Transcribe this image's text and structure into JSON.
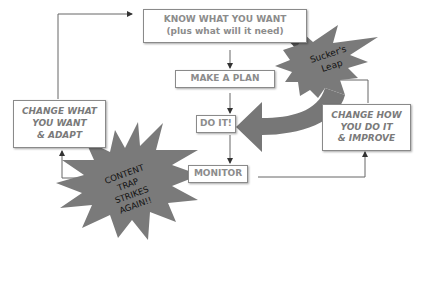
{
  "diagram": {
    "type": "flowchart",
    "nodes": {
      "know": {
        "line1": "KNOW WHAT YOU WANT",
        "line2": "(plus what will it need)"
      },
      "plan": {
        "label": "MAKE A PLAN"
      },
      "do": {
        "label": "DO IT!"
      },
      "monitor": {
        "label": "MONITOR"
      },
      "change_how": {
        "line1": "CHANGE HOW",
        "line2": "YOU DO IT",
        "line3": "& IMPROVE"
      },
      "change_what": {
        "line1": "CHANGE WHAT",
        "line2": "YOU WANT",
        "line3": "& ADAPT"
      }
    },
    "bursts": {
      "suckers_leap": {
        "line1": "Sucker's",
        "line2": "Leap"
      },
      "content_trap": {
        "line1": "CONTENT",
        "line2": "TRAP",
        "line3": "STRIKES",
        "line4": "AGAIN!!"
      }
    },
    "edges": [
      {
        "from": "know",
        "to": "plan"
      },
      {
        "from": "plan",
        "to": "do"
      },
      {
        "from": "do",
        "to": "monitor"
      },
      {
        "from": "monitor",
        "to": "change_how"
      },
      {
        "from": "change_how",
        "to": "plan"
      },
      {
        "from": "monitor",
        "to": "change_what"
      },
      {
        "from": "change_what",
        "to": "know"
      },
      {
        "from": "know",
        "to": "do",
        "label": "Sucker's Leap",
        "style": "big-curved-arrow"
      }
    ],
    "colors": {
      "box_text": "#8c8c8c",
      "burst_fill": "#7a7a7a",
      "arrow_dark": "#555555",
      "line": "#666666"
    }
  }
}
